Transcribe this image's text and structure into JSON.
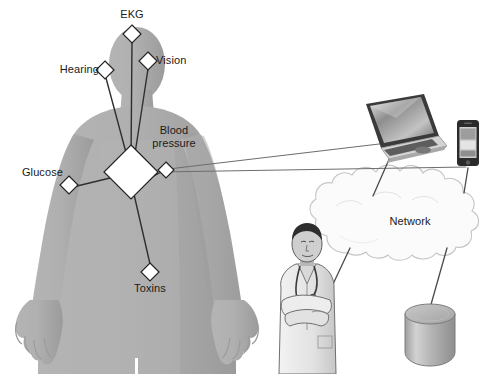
{
  "diagram": {
    "background_color": "#ffffff",
    "body_color": "#adadad",
    "body_shadow_color": "#9a9a9a",
    "line_color": "#3a3a3a",
    "thin_line_color": "#6e6e6e",
    "node_fill": "#ffffff",
    "node_stroke": "#222222",
    "text_color": "#1a1a1a"
  },
  "sensors": [
    {
      "id": "ekg",
      "label": "EKG",
      "x": 132,
      "y": 34,
      "size": 9,
      "label_x": 132,
      "label_y": 10,
      "align": "c"
    },
    {
      "id": "vision",
      "label": "Vision",
      "x": 148,
      "y": 61,
      "size": 9,
      "label_x": 156,
      "label_y": 54,
      "align": "l"
    },
    {
      "id": "hearing",
      "label": "Hearing",
      "x": 105,
      "y": 70,
      "size": 9,
      "label_x": 99,
      "label_y": 63,
      "align": "r"
    },
    {
      "id": "blood-pressure",
      "label": "Blood\npressure",
      "x": 166,
      "y": 170,
      "size": 8,
      "label_x": 174,
      "label_y": 124,
      "align": "c"
    },
    {
      "id": "glucose",
      "label": "Glucose",
      "x": 69,
      "y": 185,
      "size": 9,
      "label_x": 63,
      "label_y": 166,
      "align": "r"
    },
    {
      "id": "toxins",
      "label": "Toxins",
      "x": 150,
      "y": 272,
      "size": 9,
      "label_x": 150,
      "label_y": 281,
      "align": "c"
    }
  ],
  "hub": {
    "id": "hub",
    "label": "",
    "x": 131,
    "y": 172,
    "size": 27
  },
  "devices": [
    {
      "id": "laptop",
      "label": "",
      "x": 397,
      "y": 120
    },
    {
      "id": "phone",
      "label": "",
      "x": 468,
      "y": 142
    },
    {
      "id": "doctor",
      "label": "",
      "x": 305,
      "y": 310
    },
    {
      "id": "database",
      "label": "",
      "x": 430,
      "y": 335
    }
  ],
  "cloud": {
    "id": "network-cloud",
    "label": "Network",
    "label_x": 410,
    "label_y": 216,
    "center_x": 408,
    "center_y": 221
  },
  "links": [
    {
      "from": "hub",
      "to": "ekg"
    },
    {
      "from": "hub",
      "to": "vision"
    },
    {
      "from": "hub",
      "to": "hearing"
    },
    {
      "from": "hub",
      "to": "blood-pressure"
    },
    {
      "from": "hub",
      "to": "glucose"
    },
    {
      "from": "hub",
      "to": "toxins"
    },
    {
      "from": "blood-pressure",
      "to": "laptop"
    },
    {
      "from": "blood-pressure",
      "to": "phone"
    },
    {
      "from": "laptop",
      "to": "network-cloud"
    },
    {
      "from": "phone",
      "to": "network-cloud"
    },
    {
      "from": "network-cloud",
      "to": "doctor"
    },
    {
      "from": "network-cloud",
      "to": "database"
    }
  ]
}
